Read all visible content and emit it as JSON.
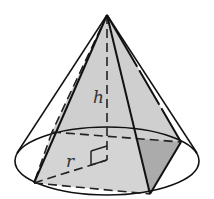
{
  "figure": {
    "labels": {
      "height": "h",
      "radius": "r"
    },
    "colors": {
      "stroke": "#111111",
      "face_light": "#d6d6d6",
      "face_dark": "#a9a9a9",
      "background": "#ffffff"
    }
  }
}
